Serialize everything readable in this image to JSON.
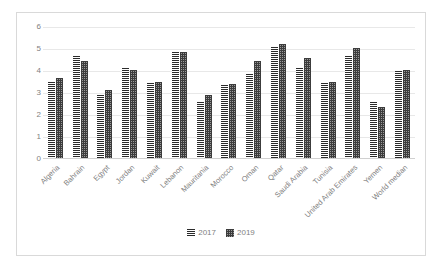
{
  "chart_data": {
    "type": "bar",
    "title": "",
    "subtitle": "",
    "xlabel": "",
    "ylabel": "",
    "ylim": [
      0,
      6
    ],
    "yticks": [
      0,
      1,
      2,
      3,
      4,
      5,
      6
    ],
    "grid": true,
    "legend_position": "bottom",
    "categories": [
      "Algeria",
      "Bahrain",
      "Egypt",
      "Jordan",
      "Kuwait",
      "Lebanon",
      "Mauritania",
      "Morocco",
      "Oman",
      "Qatar",
      "Saudi Arabia",
      "Tunisia",
      "United Arab Emirates",
      "Yemen",
      "World median"
    ],
    "series": [
      {
        "name": "2017",
        "pattern": "horizontal-stripes",
        "color": "#808080",
        "values": [
          3.5,
          4.65,
          2.9,
          4.1,
          3.45,
          4.85,
          2.55,
          3.35,
          3.85,
          5.1,
          4.1,
          3.45,
          4.65,
          2.55,
          4.0
        ]
      },
      {
        "name": "2019",
        "pattern": "checker-dots",
        "color": "#8c8c8c",
        "values": [
          3.65,
          4.45,
          3.1,
          4.05,
          3.5,
          4.85,
          2.9,
          3.4,
          4.45,
          5.2,
          4.6,
          3.5,
          5.05,
          2.35,
          4.05
        ]
      }
    ]
  },
  "legend": {
    "items": [
      {
        "label": "2017"
      },
      {
        "label": "2019"
      }
    ]
  },
  "axis": {
    "y_tick_labels": [
      "0",
      "1",
      "2",
      "3",
      "4",
      "5",
      "6"
    ]
  }
}
